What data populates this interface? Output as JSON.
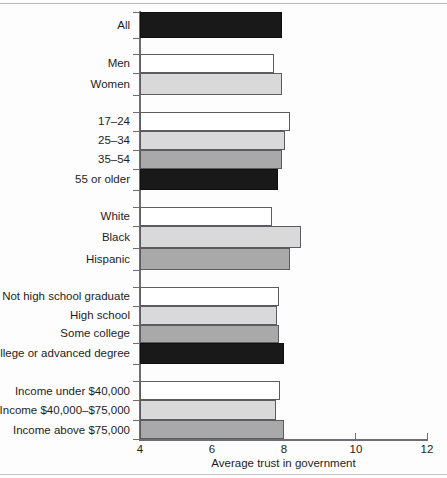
{
  "chart_data": {
    "type": "bar",
    "orientation": "horizontal",
    "title": "",
    "xlabel": "Average trust in government",
    "ylabel": "",
    "xlim": [
      4,
      12
    ],
    "xticks": [
      4,
      6,
      8,
      10,
      12
    ],
    "xtick_labels": [
      "4",
      "6",
      "8",
      "10",
      "12"
    ],
    "grid": false,
    "legend": "none",
    "categories": [
      "All",
      "Men",
      "Women",
      "17–24",
      "25–34",
      "35–54",
      "55 or older",
      "White",
      "Black",
      "Hispanic",
      "Not high school graduate",
      "High school",
      "Some college",
      "College or advanced degree",
      "Income under $40,000",
      "Income $40,000–$75,000",
      "Income above $75,000"
    ],
    "values": [
      7.95,
      7.74,
      7.96,
      8.18,
      8.04,
      7.96,
      7.85,
      7.67,
      8.48,
      8.19,
      7.86,
      7.82,
      7.88,
      8.0,
      7.9,
      7.79,
      8.0
    ],
    "groups": [
      {
        "name": "overall",
        "categories": [
          "All"
        ]
      },
      {
        "name": "gender",
        "categories": [
          "Men",
          "Women"
        ]
      },
      {
        "name": "age",
        "categories": [
          "17–24",
          "25–34",
          "35–54",
          "55 or older"
        ]
      },
      {
        "name": "race",
        "categories": [
          "White",
          "Black",
          "Hispanic"
        ]
      },
      {
        "name": "education",
        "categories": [
          "Not high school graduate",
          "High school",
          "Some college",
          "College or advanced degree"
        ]
      },
      {
        "name": "income",
        "categories": [
          "Income under $40,000",
          "Income $40,000–$75,000",
          "Income above $75,000"
        ]
      }
    ],
    "bar_shades": [
      "dark",
      "white",
      "light",
      "white",
      "light",
      "medium",
      "dark",
      "white",
      "light",
      "medium",
      "white",
      "light",
      "medium",
      "dark",
      "white",
      "light",
      "medium"
    ]
  },
  "axis": {
    "x_title": "Average trust in government",
    "tick_4": "4",
    "tick_6": "6",
    "tick_8": "8",
    "tick_10": "10",
    "tick_12": "12"
  },
  "labels": {
    "all": "All",
    "men": "Men",
    "women": "Women",
    "age_17_24": "17–24",
    "age_25_34": "25–34",
    "age_35_54": "35–54",
    "age_55_older": "55 or older",
    "white": "White",
    "black": "Black",
    "hispanic": "Hispanic",
    "edu_not_hs": "Not high school graduate",
    "edu_hs": "High school",
    "edu_some_college": "Some college",
    "edu_college": "College or advanced degree",
    "income_under_40k": "Income under $40,000",
    "income_40_75k": "Income $40,000–$75,000",
    "income_above_75k": "Income above $75,000"
  },
  "colors": {
    "fill_white": "#ffffff",
    "fill_light": "#d9d9d9",
    "fill_medium": "#a9a9a9",
    "fill_dark": "#19191a",
    "axis": "#6d6d72",
    "text": "#1d1d1f"
  }
}
